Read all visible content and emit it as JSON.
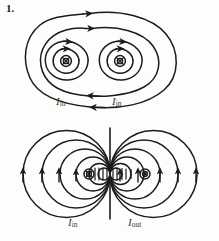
{
  "figure": {
    "number": "1.",
    "stroke_color": "#1c1c1c",
    "background_color": "#fdfdfc",
    "label_color": "#3a3a3a"
  },
  "top_diagram": {
    "name": "two-parallel-wires-same-direction",
    "description": "Two parallel current-carrying wires both directed into the page, with concentric magnetic field circles around each and two large enclosing field loops around both wires.",
    "wires": [
      {
        "id": "wire-top-left",
        "symbol": "into-page",
        "glyph": "circle-with-x",
        "cx": 63,
        "cy": 60,
        "label": "I",
        "subscript": "in",
        "field_direction": "clockwise"
      },
      {
        "id": "wire-top-right",
        "symbol": "into-page",
        "glyph": "circle-with-x",
        "cx": 117,
        "cy": 60,
        "label": "I",
        "subscript": "in",
        "field_direction": "clockwise"
      }
    ],
    "enclosing_loops": 2,
    "loop_direction": "clockwise"
  },
  "bottom_diagram": {
    "name": "two-parallel-wires-opposite-direction",
    "description": "Two parallel wires with opposite current directions separated by a vertical neutral line; nested field circles on each side tangent to the central line, with arrowheads along the horizontal midline.",
    "divider": {
      "name": "neutral-line",
      "orientation": "vertical",
      "x": 110,
      "y1": 128,
      "y2": 219
    },
    "wires": [
      {
        "id": "wire-bottom-left",
        "symbol": "into-page",
        "glyph": "circle-with-x",
        "cx": 88,
        "cy": 174,
        "label": "I",
        "subscript": "in",
        "field_direction": "clockwise"
      },
      {
        "id": "wire-bottom-right",
        "symbol": "out-of-page",
        "glyph": "circle-with-dot",
        "cx": 147,
        "cy": 174,
        "label": "I",
        "subscript": "out",
        "field_direction": "counterclockwise"
      }
    ],
    "field_arrow_direction": "upward-along-midline"
  },
  "labels": {
    "top_left": {
      "symbol": "I",
      "subscript": "in"
    },
    "top_right": {
      "symbol": "I",
      "subscript": "in"
    },
    "bottom_left": {
      "symbol": "I",
      "subscript": "in"
    },
    "bottom_right": {
      "symbol": "I",
      "subscript": "out"
    }
  }
}
